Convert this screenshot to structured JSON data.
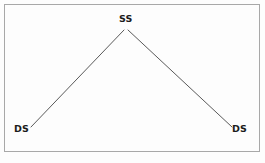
{
  "figure": {
    "type": "line-diagram",
    "shape": "inverted-v",
    "background_color": "#fdfdfd",
    "border_color": "#a8a8a8",
    "line_color": "#5a5a5a",
    "label_color": "#1c1c1c"
  },
  "nodes": [
    {
      "id": "apex",
      "label": "SS",
      "x": 126,
      "y": 30,
      "position": "top-center"
    },
    {
      "id": "left-base",
      "label": "DS",
      "x": 31,
      "y": 127,
      "position": "bottom-left"
    },
    {
      "id": "right-base",
      "label": "DS",
      "x": 232,
      "y": 127,
      "position": "bottom-right"
    }
  ],
  "edges": [
    {
      "id": "edge-left",
      "from": "left-base",
      "to": "apex",
      "x1": 31,
      "y1": 127,
      "x2": 124,
      "y2": 30
    },
    {
      "id": "edge-right",
      "from": "apex",
      "to": "right-base",
      "x1": 128,
      "y1": 30,
      "x2": 232,
      "y2": 127
    }
  ]
}
